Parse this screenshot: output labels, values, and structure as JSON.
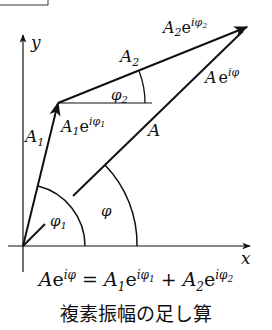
{
  "diagram": {
    "axes": {
      "x_label": "x",
      "y_label": "y"
    },
    "vectors": {
      "a1": {
        "label": "A",
        "sub": "1",
        "tip_label_base": "A",
        "tip_label_sub": "1",
        "tip_label_e": "e",
        "tip_label_exp": "iφ",
        "tip_label_exp_sub": "1"
      },
      "a2": {
        "label": "A",
        "sub": "2",
        "tip_label_base": "A",
        "tip_label_sub": "2",
        "tip_label_e": "e",
        "tip_label_exp": "iφ",
        "tip_label_exp_sub": "2"
      },
      "a": {
        "label": "A",
        "tip_label_base": "A",
        "tip_label_e": "e",
        "tip_label_exp": "iφ"
      }
    },
    "angles": {
      "phi1": {
        "label": "φ",
        "sub": "1"
      },
      "phi2": {
        "label": "φ",
        "sub": "2"
      },
      "phi": {
        "label": "φ"
      }
    },
    "stroke_color": "#111111"
  },
  "caption": {
    "equation": {
      "lhs_base": "A",
      "lhs_e": "e",
      "lhs_exp": "iφ",
      "eq": "=",
      "t1_base": "A",
      "t1_sub": "1",
      "t1_e": "e",
      "t1_exp": "iφ",
      "t1_exp_sub": "1",
      "plus": "+",
      "t2_base": "A",
      "t2_sub": "2",
      "t2_e": "e",
      "t2_exp": "iφ",
      "t2_exp_sub": "2"
    },
    "title": "複素振幅の足し算"
  }
}
